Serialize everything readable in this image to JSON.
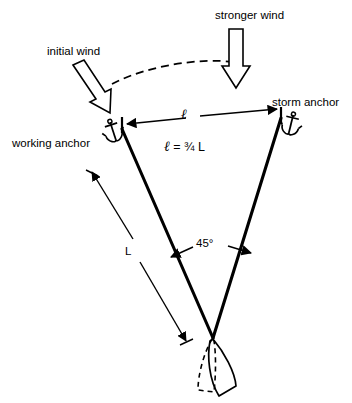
{
  "diagram": {
    "labels": {
      "stronger_wind": "stronger wind",
      "initial_wind": "initial wind",
      "storm_anchor": "storm anchor",
      "working_anchor": "working anchor",
      "ell_dimension": "ℓ",
      "ell_formula_lhs": "ℓ",
      "ell_formula_eq": " = ",
      "ell_formula_rhs": "¾ L",
      "angle": "45°",
      "rode_length": "L"
    },
    "values": {
      "angle_degrees": 45,
      "ratio_text": "ℓ = ¾ L",
      "ratio_numeric": 0.75
    },
    "icons": {
      "working_anchor_icon": "anchor-icon",
      "storm_anchor_icon": "anchor-icon",
      "initial_wind_icon": "hollow-arrow-icon",
      "stronger_wind_icon": "hollow-arrow-icon",
      "boat_initial_icon": "boat-hull-dashed-icon",
      "boat_shifted_icon": "boat-hull-solid-icon",
      "wind_shift_icon": "dashed-arc-icon"
    },
    "colors": {
      "stroke": "#000000",
      "background": "#ffffff",
      "fill_none": "none"
    }
  }
}
